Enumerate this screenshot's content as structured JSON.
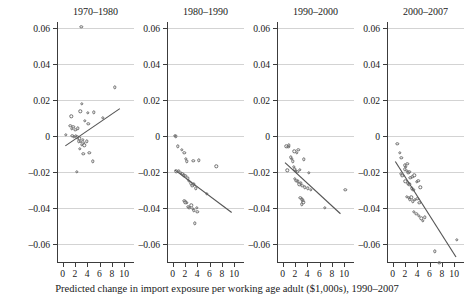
{
  "chart_data": {
    "type": "scatter",
    "title": "",
    "xlabel": "Predicted change in import exposure per working age adult ($1,000s), 1990–2007",
    "ylabel": "Manufacturing employment/population",
    "xlim": [
      -0.9,
      11.6
    ],
    "ylim": [
      -0.071,
      0.068
    ],
    "xticks": [
      0,
      2,
      4,
      6,
      8,
      10
    ],
    "xticklabels": [
      "0",
      "2",
      "4",
      "6",
      "8",
      "10"
    ],
    "yticks": [
      0.06,
      0.04,
      0.02,
      0,
      -0.02,
      -0.04,
      -0.06
    ],
    "yticklabels": [
      "0.06",
      "0.04",
      "0.02",
      "0",
      "–0.02",
      "–0.04",
      "–0.06"
    ],
    "grid": "horizontal",
    "legend": "none",
    "marker": "open-circle",
    "panels": [
      {
        "label": "1970–1980",
        "fit": {
          "x0": 0.45,
          "y0": -0.0055,
          "x1": 9.3,
          "y1": 0.0152
        },
        "points": [
          [
            3.05,
            0.0605
          ],
          [
            8.5,
            0.027
          ],
          [
            3.1,
            0.0178
          ],
          [
            4.15,
            0.0128
          ],
          [
            1.4,
            0.011
          ],
          [
            2.9,
            0.0138
          ],
          [
            5.1,
            0.0132
          ],
          [
            6.5,
            0.01
          ],
          [
            3.6,
            0.0085
          ],
          [
            4.2,
            0.0068
          ],
          [
            1.25,
            0.0055
          ],
          [
            1.75,
            0.0052
          ],
          [
            1.55,
            0.004
          ],
          [
            2.05,
            0.0035
          ],
          [
            2.5,
            0.0042
          ],
          [
            0.55,
            0.0005
          ],
          [
            1.6,
            0.0
          ],
          [
            1.85,
            -0.0004
          ],
          [
            2.15,
            0.0002
          ],
          [
            2.4,
            -0.0008
          ],
          [
            2.75,
            -0.0012
          ],
          [
            3.3,
            -0.002
          ],
          [
            2.6,
            -0.003
          ],
          [
            3.0,
            -0.0032
          ],
          [
            3.45,
            -0.0038
          ],
          [
            3.9,
            -0.003
          ],
          [
            3.15,
            -0.0048
          ],
          [
            3.55,
            -0.0052
          ],
          [
            2.85,
            -0.007
          ],
          [
            3.35,
            -0.0098
          ],
          [
            4.35,
            -0.0095
          ],
          [
            4.9,
            -0.014
          ],
          [
            2.3,
            -0.02
          ]
        ]
      },
      {
        "label": "1980–1990",
        "fit": {
          "x0": 0.35,
          "y0": -0.0188,
          "x1": 9.6,
          "y1": -0.0425
        },
        "points": [
          [
            0.35,
            0.0
          ],
          [
            0.5,
            -0.0002
          ],
          [
            0.85,
            -0.0058
          ],
          [
            1.5,
            -0.0078
          ],
          [
            1.9,
            -0.0092
          ],
          [
            2.2,
            -0.0128
          ],
          [
            2.3,
            -0.014
          ],
          [
            3.35,
            -0.0138
          ],
          [
            4.25,
            -0.0135
          ],
          [
            7.1,
            -0.0168
          ],
          [
            0.6,
            -0.0196
          ],
          [
            1.05,
            -0.0192
          ],
          [
            1.35,
            -0.0205
          ],
          [
            1.6,
            -0.021
          ],
          [
            1.8,
            -0.0218
          ],
          [
            2.05,
            -0.0222
          ],
          [
            2.45,
            -0.0235
          ],
          [
            2.65,
            -0.025
          ],
          [
            2.95,
            -0.0262
          ],
          [
            3.2,
            -0.0278
          ],
          [
            3.5,
            -0.0268
          ],
          [
            3.75,
            -0.029
          ],
          [
            5.6,
            -0.032
          ],
          [
            1.9,
            -0.036
          ],
          [
            2.1,
            -0.0368
          ],
          [
            2.35,
            -0.0372
          ],
          [
            2.55,
            -0.0392
          ],
          [
            2.75,
            -0.04
          ],
          [
            3.05,
            -0.0385
          ],
          [
            3.25,
            -0.0405
          ],
          [
            3.45,
            -0.0412
          ],
          [
            3.9,
            -0.0398
          ],
          [
            4.0,
            -0.042
          ],
          [
            3.6,
            -0.0485
          ]
        ]
      },
      {
        "label": "1990–2000",
        "fit": {
          "x0": 0.4,
          "y0": -0.0148,
          "x1": 9.4,
          "y1": -0.0432
        },
        "points": [
          [
            0.6,
            -0.0058
          ],
          [
            0.95,
            -0.006
          ],
          [
            1.05,
            -0.0052
          ],
          [
            1.9,
            -0.0085
          ],
          [
            2.3,
            -0.0092
          ],
          [
            2.55,
            -0.0078
          ],
          [
            1.3,
            -0.0118
          ],
          [
            1.55,
            -0.0128
          ],
          [
            1.7,
            -0.014
          ],
          [
            3.45,
            -0.013
          ],
          [
            0.75,
            -0.019
          ],
          [
            1.85,
            -0.0172
          ],
          [
            2.0,
            -0.0185
          ],
          [
            2.15,
            -0.0195
          ],
          [
            2.4,
            -0.02
          ],
          [
            2.8,
            -0.0188
          ],
          [
            4.3,
            -0.0205
          ],
          [
            1.95,
            -0.0238
          ],
          [
            2.25,
            -0.0248
          ],
          [
            2.5,
            -0.0252
          ],
          [
            2.7,
            -0.0268
          ],
          [
            3.0,
            -0.0262
          ],
          [
            3.2,
            -0.0275
          ],
          [
            3.6,
            -0.0285
          ],
          [
            4.1,
            -0.029
          ],
          [
            4.6,
            -0.0298
          ],
          [
            10.2,
            -0.03
          ],
          [
            2.9,
            -0.0345
          ],
          [
            3.1,
            -0.0352
          ],
          [
            3.3,
            -0.0358
          ],
          [
            3.35,
            -0.0368
          ],
          [
            3.15,
            -0.038
          ],
          [
            6.9,
            -0.04
          ]
        ]
      },
      {
        "label": "2000–2007",
        "fit": {
          "x0": 0.45,
          "y0": -0.0142,
          "x1": 10.3,
          "y1": -0.0672
        },
        "points": [
          [
            0.75,
            -0.0045
          ],
          [
            1.15,
            -0.0092
          ],
          [
            1.45,
            -0.012
          ],
          [
            1.95,
            -0.0162
          ],
          [
            2.2,
            -0.017
          ],
          [
            2.4,
            -0.0155
          ],
          [
            2.0,
            -0.0185
          ],
          [
            2.35,
            -0.0195
          ],
          [
            2.55,
            -0.0205
          ],
          [
            2.75,
            -0.0198
          ],
          [
            1.3,
            -0.021
          ],
          [
            1.6,
            -0.0222
          ],
          [
            2.9,
            -0.0232
          ],
          [
            3.2,
            -0.0228
          ],
          [
            3.55,
            -0.0218
          ],
          [
            2.1,
            -0.0252
          ],
          [
            2.45,
            -0.0262
          ],
          [
            2.7,
            -0.0268
          ],
          [
            3.9,
            -0.0255
          ],
          [
            4.2,
            -0.0248
          ],
          [
            3.1,
            -0.029
          ],
          [
            3.4,
            -0.0298
          ],
          [
            4.5,
            -0.0285
          ],
          [
            2.3,
            -0.0338
          ],
          [
            2.6,
            -0.0345
          ],
          [
            2.85,
            -0.0352
          ],
          [
            3.05,
            -0.034
          ],
          [
            3.3,
            -0.0362
          ],
          [
            3.65,
            -0.0355
          ],
          [
            4.0,
            -0.0348
          ],
          [
            4.35,
            -0.0372
          ],
          [
            3.5,
            -0.042
          ],
          [
            3.85,
            -0.0432
          ],
          [
            4.25,
            -0.0445
          ],
          [
            4.65,
            -0.0458
          ],
          [
            4.9,
            -0.047
          ],
          [
            5.25,
            -0.0452
          ],
          [
            10.4,
            -0.0578
          ],
          [
            6.9,
            -0.064
          ],
          [
            7.6,
            -0.0705
          ]
        ]
      }
    ]
  }
}
